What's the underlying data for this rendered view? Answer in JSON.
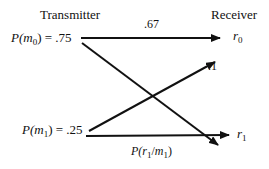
{
  "diagram": {
    "transmitter_label": "Transmitter",
    "receiver_label": "Receiver",
    "inputs": [
      {
        "symbol": "m",
        "index": "0",
        "prefix": "P(",
        "suffix": ") = .75"
      },
      {
        "symbol": "m",
        "index": "1",
        "prefix": "P(",
        "suffix": ") = .25"
      }
    ],
    "outputs": [
      {
        "symbol": "r",
        "index": "0"
      },
      {
        "symbol": "r",
        "index": "1"
      }
    ],
    "edges": [
      {
        "from": "m0",
        "to": "r0",
        "label": ".67"
      },
      {
        "from": "m1",
        "to": "r0",
        "label": ".1"
      },
      {
        "from": "m0",
        "to": "r1",
        "label": ""
      },
      {
        "from": "m1",
        "to": "r1",
        "label": "P(r1/m1)"
      }
    ],
    "edge_labels": {
      "m0_r0": ".67",
      "m1_r0": ".1",
      "m1_r1_prefix": "P(",
      "m1_r1_r": "r",
      "m1_r1_r_index": "1",
      "m1_r1_sep": "/",
      "m1_r1_m": "m",
      "m1_r1_m_index": "1",
      "m1_r1_suffix": ")"
    },
    "line_color": "#111111"
  }
}
